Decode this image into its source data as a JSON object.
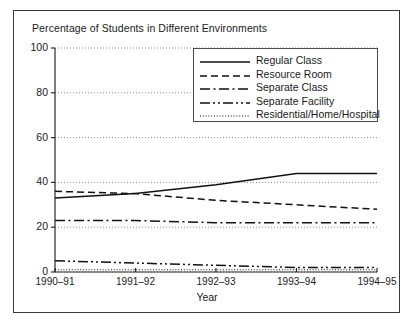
{
  "chart_data": {
    "type": "line",
    "title": "Percentage of Students in Different Environments",
    "xlabel": "Year",
    "ylabel": "",
    "categories": [
      "1990–91",
      "1991–92",
      "1992–93",
      "1993–94",
      "1994–95"
    ],
    "ylim": [
      0,
      100
    ],
    "yticks": [
      0,
      20,
      40,
      60,
      80,
      100
    ],
    "grid": true,
    "grid_style": "dotted",
    "legend_position": "upper right",
    "series": [
      {
        "name": "Regular Class",
        "style": "solid",
        "values": [
          33,
          35,
          39,
          44,
          44
        ]
      },
      {
        "name": "Resource Room",
        "style": "dashed",
        "values": [
          36,
          35,
          32,
          30,
          28
        ]
      },
      {
        "name": "Separate Class",
        "style": "dash-dot",
        "values": [
          23,
          23,
          22,
          22,
          22
        ]
      },
      {
        "name": "Separate Facility",
        "style": "dash-dot-dot",
        "values": [
          5,
          4,
          3,
          2,
          2
        ]
      },
      {
        "name": "Residential/Home/Hospital",
        "style": "dotted",
        "values": [
          1,
          1,
          1,
          1,
          1
        ]
      }
    ]
  },
  "axis": {
    "ytick_labels": [
      "100",
      "80",
      "60",
      "40",
      "20",
      "0"
    ],
    "xtick_labels": [
      "1990–91",
      "1991–92",
      "1992–93",
      "1993–94",
      "1994–95"
    ]
  },
  "colors": {
    "line": "#111111",
    "grid": "#8a8a8a",
    "frame": "#3a3a3a",
    "background": "#ffffff"
  }
}
